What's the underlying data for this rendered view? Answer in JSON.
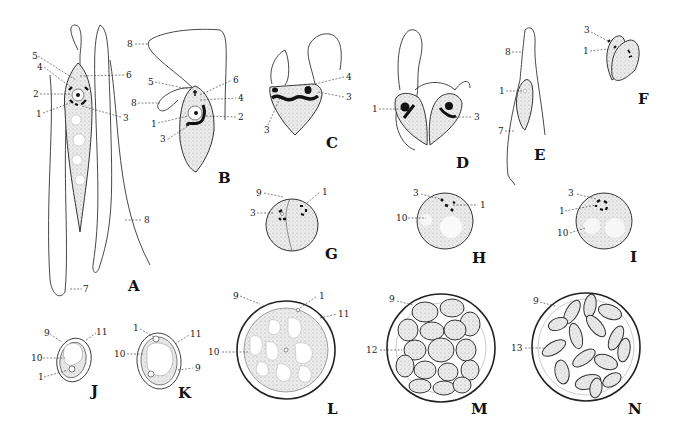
{
  "figure": {
    "type": "scientific-illustration-plate",
    "panels": [
      {
        "letter": "A",
        "labels": [
          "1",
          "2",
          "3",
          "4",
          "5",
          "6",
          "7",
          "8"
        ]
      },
      {
        "letter": "B",
        "labels": [
          "1",
          "2",
          "3",
          "4",
          "5",
          "6",
          "8",
          "8"
        ]
      },
      {
        "letter": "C",
        "labels": [
          "3",
          "3",
          "4"
        ]
      },
      {
        "letter": "D",
        "labels": [
          "1",
          "3"
        ]
      },
      {
        "letter": "E",
        "labels": [
          "1",
          "7",
          "8"
        ]
      },
      {
        "letter": "F",
        "labels": [
          "1",
          "3"
        ]
      },
      {
        "letter": "G",
        "labels": [
          "1",
          "3",
          "9"
        ]
      },
      {
        "letter": "H",
        "labels": [
          "1",
          "3",
          "10"
        ]
      },
      {
        "letter": "I",
        "labels": [
          "1",
          "3",
          "10"
        ]
      },
      {
        "letter": "J",
        "labels": [
          "1",
          "9",
          "10",
          "11"
        ]
      },
      {
        "letter": "K",
        "labels": [
          "1",
          "9",
          "10",
          "11"
        ]
      },
      {
        "letter": "L",
        "labels": [
          "1",
          "9",
          "10",
          "11"
        ]
      },
      {
        "letter": "M",
        "labels": [
          "9",
          "12"
        ]
      },
      {
        "letter": "N",
        "labels": [
          "9",
          "13"
        ]
      }
    ]
  },
  "panel_letters": {
    "A": "A",
    "B": "B",
    "C": "C",
    "D": "D",
    "E": "E",
    "F": "F",
    "G": "G",
    "H": "H",
    "I": "I",
    "J": "J",
    "K": "K",
    "L": "L",
    "M": "M",
    "N": "N"
  },
  "n": {
    "1": "1",
    "2": "2",
    "3": "3",
    "4": "4",
    "5": "5",
    "6": "6",
    "7": "7",
    "8": "8",
    "9": "9",
    "10": "10",
    "11": "11",
    "12": "12",
    "13": "13"
  }
}
